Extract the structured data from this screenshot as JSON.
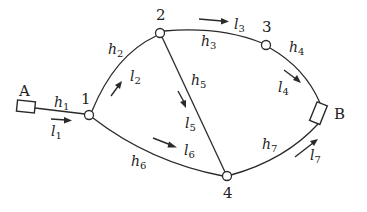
{
  "diagram": {
    "type": "network-flow-graph",
    "terminals": [
      {
        "id": "A",
        "label": "A"
      },
      {
        "id": "B",
        "label": "B"
      }
    ],
    "nodes": [
      {
        "id": "1",
        "label": "1"
      },
      {
        "id": "2",
        "label": "2"
      },
      {
        "id": "3",
        "label": "3"
      },
      {
        "id": "4",
        "label": "4"
      }
    ],
    "edges": [
      {
        "from": "A",
        "to": "1",
        "head_var": "h",
        "head_sub": "1",
        "length_var": "l",
        "length_sub": "1"
      },
      {
        "from": "1",
        "to": "2",
        "head_var": "h",
        "head_sub": "2",
        "length_var": "l",
        "length_sub": "2"
      },
      {
        "from": "2",
        "to": "3",
        "head_var": "h",
        "head_sub": "3",
        "length_var": "l",
        "length_sub": "3"
      },
      {
        "from": "3",
        "to": "B",
        "head_var": "h",
        "head_sub": "4",
        "length_var": "l",
        "length_sub": "4"
      },
      {
        "from": "2",
        "to": "4",
        "head_var": "h",
        "head_sub": "5",
        "length_var": "l",
        "length_sub": "5"
      },
      {
        "from": "1",
        "to": "4",
        "head_var": "h",
        "head_sub": "6",
        "length_var": "l",
        "length_sub": "6"
      },
      {
        "from": "4",
        "to": "B",
        "head_var": "h",
        "head_sub": "7",
        "length_var": "l",
        "length_sub": "7"
      }
    ]
  }
}
